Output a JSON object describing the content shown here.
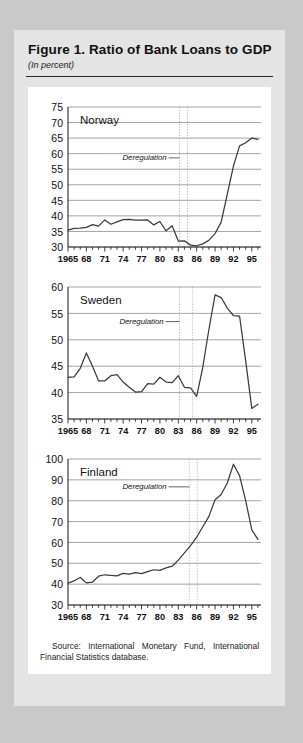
{
  "figure": {
    "title": "Figure 1.  Ratio of Bank Loans to GDP",
    "subtitle": "(In percent)",
    "source": "Source: International Monetary Fund, International Financial Statistics database."
  },
  "colors": {
    "page_background": "#c9c9c9",
    "panel_background": "#e4e4e4",
    "plot_background": "#ffffff",
    "gridline": "#9a9a9a",
    "series_line": "#3b3b3b",
    "deregulation_marker": "#b9b9b9",
    "text": "#111111"
  },
  "chart_data": [
    {
      "type": "line",
      "title": "Norway",
      "xlabel": "",
      "ylabel": "",
      "xlim": [
        1965,
        1996.5
      ],
      "ylim": [
        30,
        75
      ],
      "yticks": [
        30,
        35,
        40,
        45,
        50,
        55,
        60,
        65,
        70,
        75
      ],
      "xticks": [
        1965,
        1968,
        1971,
        1974,
        1977,
        1980,
        1983,
        1986,
        1989,
        1992,
        1995
      ],
      "xticklabels": [
        "1965",
        "68",
        "71",
        "74",
        "77",
        "80",
        "83",
        "86",
        "89",
        "92",
        "95"
      ],
      "grid": true,
      "legend": "none",
      "annotations": [
        {
          "text": "Deregulation",
          "x": 1977.5,
          "y": 57.2,
          "type": "leader-label"
        }
      ],
      "deregulation_band": [
        1983.2,
        1984.5
      ],
      "x": [
        1965,
        1966,
        1967,
        1968,
        1969,
        1970,
        1971,
        1972,
        1973,
        1974,
        1975,
        1976,
        1977,
        1978,
        1979,
        1980,
        1981,
        1982,
        1983,
        1984,
        1985,
        1986,
        1987,
        1988,
        1989,
        1990,
        1991,
        1992,
        1993,
        1994,
        1995,
        1996
      ],
      "values": [
        35.4,
        36.0,
        36.1,
        36.3,
        37.2,
        36.7,
        38.7,
        37.3,
        38.1,
        38.8,
        38.9,
        38.6,
        38.6,
        38.7,
        37.1,
        38.2,
        35.2,
        36.8,
        31.9,
        32.0,
        30.6,
        30.4,
        31.0,
        32.2,
        34.3,
        38.0,
        47.0,
        56.0,
        62.5,
        63.5,
        65.0,
        64.6
      ],
      "values_note": "extended tail: 1991-1996 segment continues 57.8, 56.2, 55.9, 55.4, 56.8, 59.0"
    },
    {
      "type": "line",
      "title": "Sweden",
      "xlabel": "",
      "ylabel": "",
      "xlim": [
        1965,
        1996.5
      ],
      "ylim": [
        35,
        60
      ],
      "yticks": [
        35,
        40,
        45,
        50,
        55,
        60
      ],
      "xticks": [
        1965,
        1968,
        1971,
        1974,
        1977,
        1980,
        1983,
        1986,
        1989,
        1992,
        1995
      ],
      "xticklabels": [
        "1965",
        "68",
        "71",
        "74",
        "77",
        "80",
        "83",
        "86",
        "89",
        "92",
        "95"
      ],
      "grid": true,
      "legend": "none",
      "annotations": [
        {
          "text": "Deregulation",
          "x": 1977.0,
          "y": 52.6,
          "type": "leader-label"
        }
      ],
      "deregulation_band": [
        1983.2,
        1985.3
      ],
      "x": [
        1965,
        1966,
        1967,
        1968,
        1969,
        1970,
        1971,
        1972,
        1973,
        1974,
        1975,
        1976,
        1977,
        1978,
        1979,
        1980,
        1981,
        1982,
        1983,
        1984,
        1985,
        1986,
        1987,
        1988,
        1989,
        1990,
        1991,
        1992,
        1993,
        1994,
        1995,
        1996
      ],
      "values": [
        42.9,
        43.0,
        44.6,
        47.5,
        45.0,
        42.2,
        42.2,
        43.2,
        43.4,
        42.0,
        41.0,
        40.1,
        40.2,
        41.7,
        41.6,
        42.9,
        42.0,
        41.9,
        43.2,
        41.0,
        40.9,
        39.3,
        44.8,
        52.0,
        58.5,
        58.0,
        56.0,
        54.6,
        54.5,
        46.0,
        37.0,
        37.8
      ]
    },
    {
      "type": "line",
      "title": "Finland",
      "xlabel": "",
      "ylabel": "",
      "xlim": [
        1965,
        1996.5
      ],
      "ylim": [
        30,
        100
      ],
      "yticks": [
        30,
        40,
        50,
        60,
        70,
        80,
        90,
        100
      ],
      "xticks": [
        1965,
        1968,
        1971,
        1974,
        1977,
        1980,
        1983,
        1986,
        1989,
        1992,
        1995
      ],
      "xticklabels": [
        "1965",
        "68",
        "71",
        "74",
        "77",
        "80",
        "83",
        "86",
        "89",
        "92",
        "95"
      ],
      "grid": true,
      "legend": "none",
      "annotations": [
        {
          "text": "Deregulation",
          "x": 1977.5,
          "y": 84.5,
          "type": "leader-label"
        }
      ],
      "deregulation_band": [
        1984.8,
        1986.1
      ],
      "x": [
        1965,
        1966,
        1967,
        1968,
        1969,
        1970,
        1971,
        1972,
        1973,
        1974,
        1975,
        1976,
        1977,
        1978,
        1979,
        1980,
        1981,
        1982,
        1983,
        1984,
        1985,
        1986,
        1987,
        1988,
        1989,
        1990,
        1991,
        1992,
        1993,
        1994,
        1995,
        1996
      ],
      "values": [
        40.5,
        41.6,
        43.2,
        40.6,
        41.0,
        43.8,
        44.5,
        44.2,
        44.0,
        45.2,
        44.8,
        45.5,
        45.0,
        46.0,
        46.9,
        46.6,
        47.8,
        48.6,
        51.5,
        55.0,
        58.5,
        62.5,
        67.5,
        72.5,
        80.5,
        83.0,
        88.5,
        97.5,
        92.0,
        80.0,
        66.0,
        61.5
      ]
    }
  ]
}
